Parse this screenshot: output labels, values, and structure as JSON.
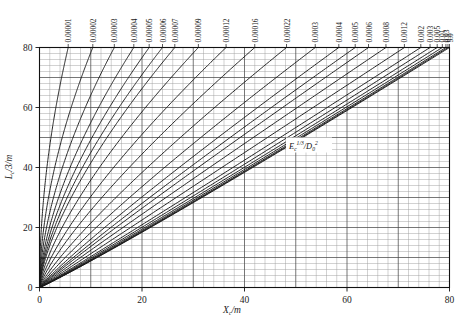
{
  "chart_data": {
    "type": "line",
    "title": "",
    "subtitle": "",
    "xlabel": "X_c/m",
    "ylabel": "L_c/3/m",
    "xlabel_parts": {
      "main": "X",
      "sub": "c",
      "tail": "/m"
    },
    "ylabel_parts": {
      "main": "L",
      "sub": "c",
      "tail": "/3/m"
    },
    "xlim": [
      0,
      80
    ],
    "ylim": [
      0,
      80
    ],
    "xticks": [
      0,
      20,
      40,
      60,
      80
    ],
    "yticks": [
      0,
      20,
      40,
      60,
      80
    ],
    "xticklabels": [
      "0",
      "20",
      "40",
      "60",
      "80"
    ],
    "yticklabels": [
      "0",
      "20",
      "40",
      "60",
      "80"
    ],
    "grid": true,
    "grid_minor_step": 2,
    "grid_major_step": 10,
    "legend_position": "top-axis-labels",
    "annotation": {
      "text": "E_c^(1/3)/D_0^2",
      "base": "E",
      "base_sub": "c",
      "base_sup": "1/3",
      "denom": "D",
      "denom_sub": "0",
      "denom_sup": "2",
      "x": 52,
      "y": 47
    },
    "parameter_name": "E_c^(1/3)/D_0^2",
    "series": [
      {
        "name": "0.00001",
        "label": "0.00001",
        "x_at_ymax": 5.6
      },
      {
        "name": "0.00002",
        "label": "0.00002",
        "x_at_ymax": 10.4
      },
      {
        "name": "0.00003",
        "label": "0.00003",
        "x_at_ymax": 14.6
      },
      {
        "name": "0.00004",
        "label": "0.00004",
        "x_at_ymax": 18.4
      },
      {
        "name": "0.00005",
        "label": "0.00005",
        "x_at_ymax": 21.4
      },
      {
        "name": "0.00006",
        "label": "0.00006",
        "x_at_ymax": 24.0
      },
      {
        "name": "0.00007",
        "label": "0.00007",
        "x_at_ymax": 26.4
      },
      {
        "name": "0.00009",
        "label": "0.00009",
        "x_at_ymax": 31.0
      },
      {
        "name": "0.00012",
        "label": "0.00012",
        "x_at_ymax": 36.4
      },
      {
        "name": "0.00016",
        "label": "0.00016",
        "x_at_ymax": 42.0
      },
      {
        "name": "0.00022",
        "label": "0.00022",
        "x_at_ymax": 48.2
      },
      {
        "name": "0.0003",
        "label": "0.0003",
        "x_at_ymax": 53.8
      },
      {
        "name": "0.0004",
        "label": "0.0004",
        "x_at_ymax": 58.4
      },
      {
        "name": "0.0005",
        "label": "0.0005",
        "x_at_ymax": 61.6
      },
      {
        "name": "0.0006",
        "label": "0.0006",
        "x_at_ymax": 64.2
      },
      {
        "name": "0.0008",
        "label": "0.0008",
        "x_at_ymax": 67.6
      },
      {
        "name": "0.0012",
        "label": "0.0012",
        "x_at_ymax": 71.2
      },
      {
        "name": "0.002",
        "label": "0.002",
        "x_at_ymax": 74.4
      },
      {
        "name": "0.003",
        "label": "0.003",
        "x_at_ymax": 76.2
      },
      {
        "name": "0.005",
        "label": "0.005",
        "x_at_ymax": 77.6
      },
      {
        "name": "0.01",
        "label": "0.01",
        "x_at_ymax": 78.6
      },
      {
        "name": "0.03",
        "label": "0.03",
        "x_at_ymax": 79.3
      },
      {
        "name": "0.1",
        "label": "0.1",
        "x_at_ymax": 79.7
      },
      {
        "name": "5.0",
        "label": "5.0",
        "x_at_ymax": 80.0
      }
    ]
  },
  "colors": {
    "curve": "#1a1a1a",
    "grid_minor": "#9a9a9a",
    "grid_major": "#4a4a4a",
    "axis": "#111111",
    "background": "#ffffff"
  }
}
